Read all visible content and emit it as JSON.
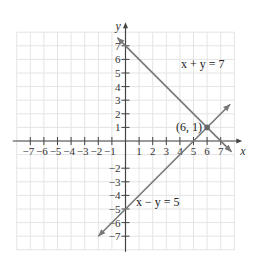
{
  "chart_data": {
    "type": "line",
    "title": "",
    "xlabel": "x",
    "ylabel": "y",
    "xlim": [
      -8,
      8
    ],
    "ylim": [
      -8,
      8
    ],
    "grid": true,
    "x_ticks": [
      -7,
      -6,
      -5,
      -4,
      -3,
      -2,
      -1,
      1,
      2,
      3,
      4,
      5,
      6,
      7
    ],
    "y_ticks": [
      -7,
      -6,
      -5,
      -4,
      -3,
      -2,
      1,
      2,
      3,
      4,
      5,
      6,
      7
    ],
    "x_tick_labels": [
      "−7",
      "−6",
      "−5",
      "−4",
      "−3",
      "−2",
      "−1",
      "1",
      "2",
      "3",
      "4",
      "5",
      "6",
      "7"
    ],
    "y_tick_labels": [
      "−7",
      "−6",
      "−5",
      "−4",
      "−3",
      "−2",
      "1",
      "2",
      "3",
      "4",
      "5",
      "6",
      "7"
    ],
    "series": [
      {
        "name": "x + y = 7",
        "equation": "x + y = 7",
        "x": [
          -0.6,
          7.8
        ],
        "y": [
          7.6,
          -0.8
        ],
        "color": "#777777"
      },
      {
        "name": "x − y = 5",
        "equation": "x − y = 5",
        "x": [
          -2.0,
          7.7
        ],
        "y": [
          -7.0,
          2.7
        ],
        "color": "#777777"
      }
    ],
    "annotations": [
      {
        "text": "(6, 1)",
        "x": 6,
        "y": 1,
        "type": "intersection-point"
      },
      {
        "text": "x + y = 7",
        "x": 2.0,
        "y": 5.0
      },
      {
        "text": "x − y = 5",
        "x": 0.6,
        "y": -4.5
      }
    ]
  },
  "labels": {
    "x_axis": "x",
    "y_axis": "y",
    "line1": "x + y = 7",
    "line2": "x − y = 5",
    "point": "(6, 1)"
  }
}
